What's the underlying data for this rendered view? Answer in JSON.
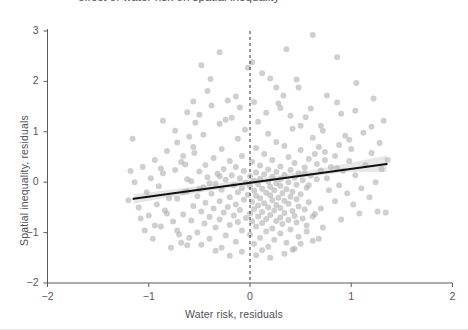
{
  "figure": {
    "title_partial": "effect of water risk on spatial inequality",
    "background_color": "#ffffff",
    "width": 468,
    "height": 330
  },
  "chart_data": {
    "type": "scatter",
    "title": "",
    "xlabel": "Water risk, residuals",
    "ylabel": "Spatial inequality, residuals",
    "xlim": [
      -2,
      2
    ],
    "ylim": [
      -2,
      3
    ],
    "xticks": [
      -2,
      -1,
      0,
      1,
      2
    ],
    "yticks": [
      -2,
      -1,
      0,
      1,
      2,
      3
    ],
    "xtick_labels": [
      "−2",
      "−1",
      "0",
      "1",
      "2"
    ],
    "ytick_labels": [
      "−2",
      "−1",
      "0",
      "1",
      "2",
      "3"
    ],
    "grid": false,
    "legend": "none",
    "point_color": "#b2b2b2",
    "point_opacity": 0.62,
    "point_radius": 3.0,
    "line_color": "#111111",
    "band_color": "#c9c9c9",
    "band_opacity": 0.45,
    "reference_line": {
      "orientation": "vertical",
      "x": 0,
      "style": "dashed",
      "color": "#333333"
    },
    "fit_line": {
      "x_start": -1.15,
      "y_start": -0.33,
      "x_end": 1.35,
      "y_end": 0.36,
      "slope": 0.276,
      "intercept": -0.013
    },
    "confidence_band": {
      "x": [
        -1.15,
        -0.8,
        -0.45,
        -0.1,
        0.25,
        0.6,
        0.95,
        1.35
      ],
      "upper": [
        -0.24,
        -0.155,
        -0.062,
        0.028,
        0.125,
        0.235,
        0.365,
        0.53
      ],
      "lower": [
        -0.425,
        -0.305,
        -0.19,
        -0.082,
        0.022,
        0.113,
        0.2,
        0.2
      ]
    },
    "points": [
      [
        0.62,
        2.92
      ],
      [
        0.02,
        2.38
      ],
      [
        -0.48,
        2.32
      ],
      [
        0.86,
        2.48
      ],
      [
        -0.39,
        2.05
      ],
      [
        -0.42,
        1.81
      ],
      [
        1.05,
        1.97
      ],
      [
        -0.02,
        2.27
      ],
      [
        0.12,
        2.16
      ],
      [
        0.33,
        1.72
      ],
      [
        0.2,
        2.06
      ],
      [
        -0.22,
        1.62
      ],
      [
        0.48,
        1.88
      ],
      [
        0.04,
        1.59
      ],
      [
        0.3,
        1.47
      ],
      [
        -0.62,
        1.39
      ],
      [
        0.55,
        1.29
      ],
      [
        0.9,
        1.36
      ],
      [
        1.2,
        1.1
      ],
      [
        -0.18,
        1.28
      ],
      [
        -0.3,
        1.16
      ],
      [
        0.08,
        1.2
      ],
      [
        0.42,
        1.06
      ],
      [
        0.7,
        1.12
      ],
      [
        -0.05,
        1.04
      ],
      [
        0.18,
        0.96
      ],
      [
        -0.46,
        0.94
      ],
      [
        0.62,
        0.88
      ],
      [
        0.98,
        0.84
      ],
      [
        -0.72,
        0.79
      ],
      [
        0.26,
        0.8
      ],
      [
        -0.12,
        0.86
      ],
      [
        0.34,
        0.72
      ],
      [
        0.06,
        0.68
      ],
      [
        -0.28,
        0.66
      ],
      [
        0.5,
        0.64
      ],
      [
        0.74,
        0.6
      ],
      [
        -0.55,
        0.58
      ],
      [
        0.14,
        0.56
      ],
      [
        -0.08,
        0.52
      ],
      [
        0.38,
        0.5
      ],
      [
        0.58,
        0.46
      ],
      [
        -0.36,
        0.48
      ],
      [
        0.22,
        0.44
      ],
      [
        -0.2,
        0.42
      ],
      [
        0.02,
        0.4
      ],
      [
        0.44,
        0.38
      ],
      [
        0.66,
        0.36
      ],
      [
        -0.64,
        0.35
      ],
      [
        -0.44,
        0.34
      ],
      [
        0.1,
        0.33
      ],
      [
        0.3,
        0.31
      ],
      [
        -0.14,
        0.3
      ],
      [
        0.54,
        0.29
      ],
      [
        0.86,
        0.28
      ],
      [
        -0.88,
        0.27
      ],
      [
        -0.26,
        0.26
      ],
      [
        0.18,
        0.25
      ],
      [
        0.4,
        0.24
      ],
      [
        0.7,
        0.23
      ],
      [
        -0.06,
        0.22
      ],
      [
        -0.5,
        0.21
      ],
      [
        0.26,
        0.2
      ],
      [
        0.06,
        0.19
      ],
      [
        0.48,
        0.18
      ],
      [
        -0.32,
        0.17
      ],
      [
        0.14,
        0.16
      ],
      [
        0.34,
        0.15
      ],
      [
        -0.18,
        0.14
      ],
      [
        0.6,
        0.13
      ],
      [
        0.0,
        0.12
      ],
      [
        0.22,
        0.11
      ],
      [
        -0.42,
        0.1
      ],
      [
        0.44,
        0.09
      ],
      [
        -0.1,
        0.08
      ],
      [
        0.1,
        0.07
      ],
      [
        0.3,
        0.06
      ],
      [
        -0.24,
        0.05
      ],
      [
        0.52,
        0.04
      ],
      [
        0.04,
        0.03
      ],
      [
        -0.58,
        0.02
      ],
      [
        0.18,
        0.01
      ],
      [
        0.38,
        0.0
      ],
      [
        -0.04,
        -0.01
      ],
      [
        0.26,
        -0.02
      ],
      [
        -0.34,
        -0.03
      ],
      [
        0.08,
        -0.04
      ],
      [
        0.46,
        -0.05
      ],
      [
        -0.16,
        -0.06
      ],
      [
        0.3,
        -0.07
      ],
      [
        0.0,
        -0.08
      ],
      [
        0.2,
        -0.09
      ],
      [
        -0.46,
        -0.1
      ],
      [
        0.56,
        -0.11
      ],
      [
        -0.08,
        -0.12
      ],
      [
        0.12,
        -0.13
      ],
      [
        0.36,
        -0.14
      ],
      [
        -0.28,
        -0.15
      ],
      [
        0.24,
        -0.16
      ],
      [
        0.04,
        -0.17
      ],
      [
        -0.62,
        -0.18
      ],
      [
        0.42,
        -0.19
      ],
      [
        -0.12,
        -0.2
      ],
      [
        0.16,
        -0.21
      ],
      [
        0.32,
        -0.22
      ],
      [
        -0.38,
        -0.23
      ],
      [
        0.5,
        -0.24
      ],
      [
        -0.02,
        -0.25
      ],
      [
        0.2,
        -0.26
      ],
      [
        0.06,
        -0.27
      ],
      [
        -0.52,
        -0.28
      ],
      [
        0.4,
        -0.29
      ],
      [
        -0.2,
        -0.3
      ],
      [
        0.28,
        -0.31
      ],
      [
        0.1,
        -0.32
      ],
      [
        -0.72,
        -0.33
      ],
      [
        0.46,
        -0.34
      ],
      [
        -0.06,
        -0.35
      ],
      [
        0.22,
        -0.36
      ],
      [
        0.34,
        -0.37
      ],
      [
        -0.3,
        -0.38
      ],
      [
        0.02,
        -0.39
      ],
      [
        0.58,
        -0.4
      ],
      [
        -0.44,
        -0.41
      ],
      [
        0.14,
        -0.42
      ],
      [
        0.38,
        -0.43
      ],
      [
        -0.14,
        -0.44
      ],
      [
        0.26,
        -0.45
      ],
      [
        0.08,
        -0.46
      ],
      [
        -0.56,
        -0.47
      ],
      [
        0.48,
        -0.48
      ],
      [
        -0.22,
        -0.49
      ],
      [
        0.18,
        -0.5
      ],
      [
        0.3,
        -0.51
      ],
      [
        -0.36,
        -0.52
      ],
      [
        0.04,
        -0.53
      ],
      [
        0.54,
        -0.54
      ],
      [
        -0.1,
        -0.55
      ],
      [
        0.24,
        -0.56
      ],
      [
        0.42,
        -0.57
      ],
      [
        -0.48,
        -0.58
      ],
      [
        0.12,
        -0.59
      ],
      [
        -0.26,
        -0.6
      ],
      [
        0.34,
        -0.61
      ],
      [
        0.0,
        -0.62
      ],
      [
        0.64,
        -0.63
      ],
      [
        -0.66,
        -0.64
      ],
      [
        0.2,
        -0.65
      ],
      [
        -0.16,
        -0.66
      ],
      [
        0.44,
        -0.67
      ],
      [
        0.08,
        -0.68
      ],
      [
        -0.4,
        -0.69
      ],
      [
        0.3,
        -0.7
      ],
      [
        -0.04,
        -0.71
      ],
      [
        0.52,
        -0.72
      ],
      [
        0.16,
        -0.73
      ],
      [
        -0.3,
        -0.74
      ],
      [
        0.38,
        -0.75
      ],
      [
        -0.58,
        -0.76
      ],
      [
        0.26,
        -0.77
      ],
      [
        0.02,
        -0.78
      ],
      [
        -0.12,
        -0.79
      ],
      [
        0.46,
        -0.8
      ],
      [
        0.12,
        -0.81
      ],
      [
        -0.45,
        -0.82
      ],
      [
        0.32,
        -0.83
      ],
      [
        -0.2,
        -0.85
      ],
      [
        0.56,
        -0.86
      ],
      [
        0.06,
        -0.88
      ],
      [
        -0.34,
        -0.9
      ],
      [
        0.22,
        -0.92
      ],
      [
        0.4,
        -0.94
      ],
      [
        -0.08,
        -0.96
      ],
      [
        0.16,
        -0.98
      ],
      [
        -0.52,
        -1.0
      ],
      [
        0.3,
        -1.02
      ],
      [
        0.0,
        -1.04
      ],
      [
        -0.24,
        -1.06
      ],
      [
        0.48,
        -1.08
      ],
      [
        0.1,
        -1.1
      ],
      [
        -0.4,
        -1.12
      ],
      [
        0.24,
        -1.14
      ],
      [
        0.62,
        -1.16
      ],
      [
        -0.14,
        -1.18
      ],
      [
        0.36,
        -1.2
      ],
      [
        0.04,
        -1.22
      ],
      [
        -0.62,
        -1.25
      ],
      [
        0.18,
        -1.28
      ],
      [
        -0.28,
        -1.3
      ],
      [
        0.44,
        -1.32
      ],
      [
        0.12,
        -1.35
      ],
      [
        0.72,
        -0.9
      ],
      [
        0.9,
        -0.74
      ],
      [
        1.08,
        -0.62
      ],
      [
        1.26,
        -0.58
      ],
      [
        1.34,
        -0.6
      ],
      [
        1.02,
        -0.44
      ],
      [
        0.84,
        -0.38
      ],
      [
        1.18,
        -0.3
      ],
      [
        0.96,
        -0.22
      ],
      [
        0.78,
        -0.16
      ],
      [
        1.1,
        -0.12
      ],
      [
        0.88,
        -0.06
      ],
      [
        1.24,
        0.0
      ],
      [
        0.76,
        0.08
      ],
      [
        1.04,
        0.14
      ],
      [
        0.92,
        0.22
      ],
      [
        1.3,
        0.26
      ],
      [
        0.8,
        0.3
      ],
      [
        1.14,
        0.34
      ],
      [
        0.98,
        0.42
      ],
      [
        1.36,
        0.44
      ],
      [
        0.84,
        0.52
      ],
      [
        1.2,
        0.58
      ],
      [
        1.0,
        0.66
      ],
      [
        0.88,
        0.74
      ],
      [
        1.28,
        0.78
      ],
      [
        0.94,
        0.92
      ],
      [
        1.12,
        0.98
      ],
      [
        1.32,
        1.22
      ],
      [
        0.86,
        1.58
      ],
      [
        1.22,
        1.66
      ],
      [
        -0.82,
        0.62
      ],
      [
        -0.94,
        0.44
      ],
      [
        -1.06,
        0.3
      ],
      [
        -0.86,
        0.18
      ],
      [
        -0.98,
        0.08
      ],
      [
        -1.14,
        0.0
      ],
      [
        -0.9,
        -0.08
      ],
      [
        -1.02,
        -0.2
      ],
      [
        -0.8,
        -0.32
      ],
      [
        -0.92,
        -0.44
      ],
      [
        -1.1,
        -0.5
      ],
      [
        -0.84,
        -0.56
      ],
      [
        -1.0,
        -0.66
      ],
      [
        -0.76,
        -0.78
      ],
      [
        -0.88,
        -0.88
      ],
      [
        -1.04,
        -0.96
      ],
      [
        -0.7,
        -1.04
      ],
      [
        -0.96,
        -1.12
      ],
      [
        -0.68,
        -1.2
      ],
      [
        -0.78,
        -1.3
      ],
      [
        -1.18,
        0.22
      ],
      [
        -1.2,
        -0.36
      ],
      [
        -1.16,
        0.86
      ],
      [
        -0.74,
        1.02
      ],
      [
        -0.66,
        0.52
      ],
      [
        -0.6,
        0.9
      ],
      [
        -0.54,
        1.18
      ],
      [
        -0.68,
        0.4
      ],
      [
        -0.56,
        0.7
      ],
      [
        -0.5,
        1.34
      ],
      [
        0.68,
        0.7
      ],
      [
        0.72,
        1.02
      ],
      [
        0.6,
        1.46
      ],
      [
        0.5,
        1.12
      ],
      [
        0.4,
        1.32
      ],
      [
        0.28,
        1.56
      ],
      [
        0.16,
        1.38
      ],
      [
        -0.1,
        1.48
      ],
      [
        -0.24,
        1.24
      ],
      [
        -0.38,
        1.52
      ],
      [
        0.54,
        0.18
      ],
      [
        0.66,
        0.06
      ],
      [
        0.58,
        -0.06
      ],
      [
        0.74,
        0.44
      ],
      [
        0.64,
        0.56
      ],
      [
        0.7,
        -0.52
      ],
      [
        0.62,
        -0.68
      ],
      [
        0.56,
        -0.98
      ],
      [
        0.68,
        -1.12
      ],
      [
        0.5,
        -1.22
      ],
      [
        0.42,
        -1.34
      ],
      [
        0.34,
        -1.42
      ],
      [
        0.2,
        -1.5
      ],
      [
        0.06,
        -1.45
      ],
      [
        -0.08,
        -1.38
      ],
      [
        -0.2,
        -1.46
      ],
      [
        -0.34,
        -1.36
      ],
      [
        -0.48,
        -1.24
      ],
      [
        -0.6,
        -1.1
      ],
      [
        -0.72,
        -0.96
      ],
      [
        0.26,
        1.88
      ],
      [
        -0.14,
        1.7
      ],
      [
        0.76,
        1.72
      ],
      [
        1.04,
        1.42
      ],
      [
        -0.3,
        2.58
      ],
      [
        0.46,
        2.04
      ],
      [
        -0.56,
        1.6
      ],
      [
        0.36,
        2.64
      ],
      [
        -0.66,
        -0.2
      ],
      [
        -0.82,
        -0.62
      ],
      [
        -0.94,
        -0.86
      ],
      [
        -1.08,
        -0.72
      ],
      [
        -0.86,
        1.22
      ],
      [
        -0.74,
        0.24
      ],
      [
        -0.62,
        0.06
      ],
      [
        -0.5,
        -0.14
      ],
      [
        -0.4,
        -0.02
      ],
      [
        -0.3,
        0.12
      ]
    ]
  }
}
